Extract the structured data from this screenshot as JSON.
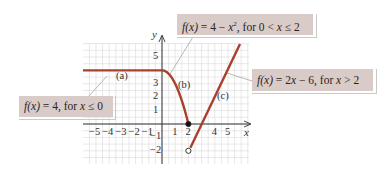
{
  "chart_data": {
    "type": "line",
    "title": "",
    "xlabel": "x",
    "ylabel": "y",
    "xlim": [
      -6,
      6
    ],
    "ylim": [
      -3,
      6
    ],
    "grid": true,
    "x_ticks": [
      "−5",
      "−4",
      "−3",
      "−2",
      "−1",
      "1",
      "2",
      "4",
      "5"
    ],
    "y_ticks": [
      "5",
      "3",
      "2",
      "1",
      "−1",
      "−2"
    ],
    "series": [
      {
        "name": "(a)",
        "formula": "f(x) = 4, for x ≤ 0",
        "x": [
          -6,
          0
        ],
        "y": [
          4,
          4
        ]
      },
      {
        "name": "(b)",
        "formula": "f(x) = 4 − x², for 0 < x ≤ 2",
        "x": [
          0,
          0.5,
          1,
          1.5,
          2
        ],
        "y": [
          4,
          3.75,
          3,
          1.75,
          0
        ]
      },
      {
        "name": "(c)",
        "formula": "f(x) = 2x − 6, for x > 2",
        "x": [
          2,
          5.9
        ],
        "y": [
          -2,
          5.8
        ]
      }
    ],
    "points": [
      {
        "x": 2,
        "y": 0,
        "style": "closed"
      },
      {
        "x": 2,
        "y": -2,
        "style": "open"
      }
    ],
    "annotations": [
      "(a)",
      "(b)",
      "(c)"
    ],
    "colors": {
      "curve": "#a8402f",
      "callout": "#d9ccc8",
      "grid": "#d8d8d8",
      "axis": "#333333"
    }
  },
  "labels": {
    "part_a": "(a)",
    "part_b": "(b)",
    "part_c": "(c)",
    "x_axis": "x",
    "y_axis": "y"
  },
  "callouts": {
    "a": {
      "prefix": "f(x)",
      "rest": " = 4, for ",
      "var": "x",
      "tail": " ≤ 0"
    },
    "b": {
      "prefix": "f(x)",
      "rest": " = 4 − ",
      "var": "x",
      "sup": "2",
      "rest2": ", for  0 < ",
      "var2": "x",
      "tail": " ≤ 2"
    },
    "c": {
      "prefix": "f(x)",
      "rest": " = 2",
      "var": "x",
      "rest2": " − 6, for  ",
      "var2": "x",
      "tail": " > 2"
    }
  },
  "ticks": {
    "x": [
      {
        "label": "−5",
        "v": -5
      },
      {
        "label": "−4",
        "v": -4
      },
      {
        "label": "−3",
        "v": -3
      },
      {
        "label": "−2",
        "v": -2
      },
      {
        "label": "−1",
        "v": -1
      },
      {
        "label": "1",
        "v": 1
      },
      {
        "label": "2",
        "v": 2
      },
      {
        "label": "4",
        "v": 4
      },
      {
        "label": "5",
        "v": 5
      }
    ],
    "y": [
      {
        "label": "5",
        "v": 5
      },
      {
        "label": "3",
        "v": 3
      },
      {
        "label": "2",
        "v": 2
      },
      {
        "label": "1",
        "v": 1
      },
      {
        "label": "−1",
        "v": -1
      },
      {
        "label": "−2",
        "v": -2
      }
    ]
  }
}
